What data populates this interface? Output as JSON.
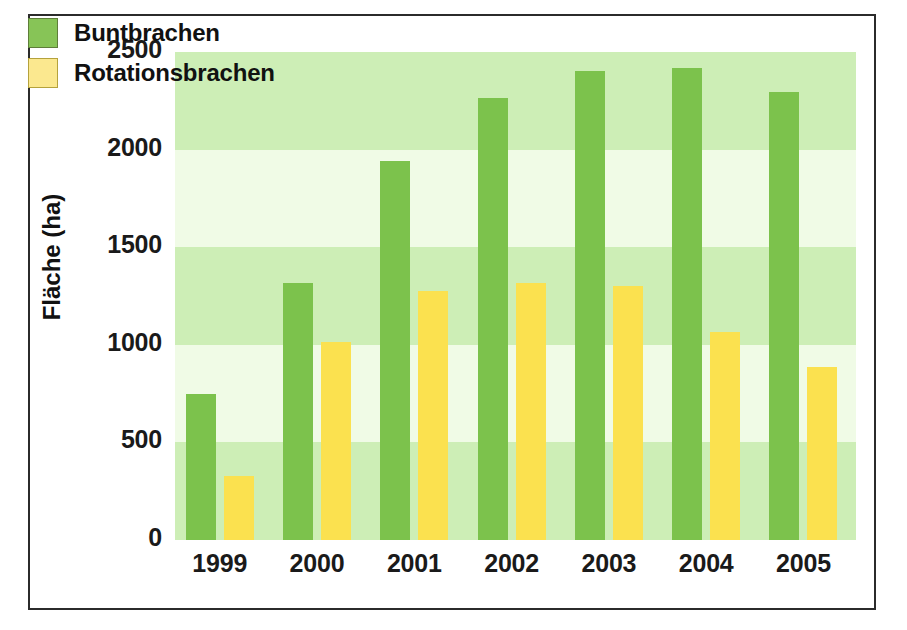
{
  "chart_data": {
    "type": "bar",
    "title": "",
    "xlabel": "",
    "ylabel": "Fläche (ha)",
    "categories": [
      "1999",
      "2000",
      "2001",
      "2002",
      "2003",
      "2004",
      "2005"
    ],
    "series": [
      {
        "name": "Buntbrachen",
        "color": "#7cc24c",
        "values": [
          750,
          1315,
          1940,
          2265,
          2405,
          2420,
          2295
        ]
      },
      {
        "name": "Rotationsbrachen",
        "color": "#fbe14f",
        "values": [
          330,
          1015,
          1275,
          1315,
          1300,
          1065,
          885
        ]
      }
    ],
    "ylim": [
      0,
      2500
    ],
    "yticks": [
      0,
      500,
      1000,
      1500,
      2000,
      2500
    ],
    "ytick_labels": [
      "0",
      "500",
      "1000",
      "1500",
      "2000",
      "2500"
    ],
    "grid": false,
    "background_bands": true,
    "legend_position": "top-left"
  },
  "legend": {
    "items": [
      {
        "label": "Buntbrachen",
        "swatch": "green-swatch"
      },
      {
        "label": "Rotationsbrachen",
        "swatch": "yellow-swatch"
      }
    ]
  },
  "colors": {
    "bar_green": "#7cc24c",
    "bar_yellow": "#fbe14f",
    "band_light": "#f0fbe6",
    "band_dark": "#cdeeb6",
    "frame": "#2b2b2b",
    "text": "#111111"
  }
}
